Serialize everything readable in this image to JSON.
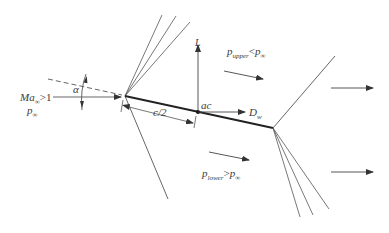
{
  "diagram": {
    "colors": {
      "line": "#555555",
      "chord": "#222222",
      "text": "#3a3a3a",
      "background": "#ffffff"
    },
    "labels": {
      "freestream_mach": {
        "base": "Ma",
        "sub": "∞",
        "rel": ">1"
      },
      "freestream_pressure": {
        "base": "p",
        "sub": "∞"
      },
      "angle_of_attack": "α",
      "half_chord": "c/2",
      "aero_center": "ac",
      "lift": "L",
      "wave_drag": {
        "base": "D",
        "sub": "w"
      },
      "upper_pressure": {
        "base": "p",
        "sub": "upper",
        "rel": "<",
        "rhs_base": "p",
        "rhs_sub": "∞"
      },
      "lower_pressure": {
        "base": "p",
        "sub": "lower",
        "rel": ">",
        "rhs_base": "p",
        "rhs_sub": "∞"
      },
      "tick_marks": [
        "ı",
        "ı"
      ]
    },
    "geometry": {
      "leading_edge": [
        125,
        96
      ],
      "aerodynamic_center": [
        198,
        112
      ],
      "trailing_edge": [
        273,
        128
      ],
      "upper_expansion_fan_ends": [
        [
          162,
          15
        ],
        [
          176,
          16
        ],
        [
          190,
          22
        ]
      ],
      "leading_edge_lower_shock_end": [
        168,
        199
      ],
      "trailing_edge_upper_shock_end": [
        335,
        56
      ],
      "lower_expansion_fan_ends": [
        [
          300,
          217
        ],
        [
          313,
          215
        ],
        [
          329,
          209
        ]
      ]
    }
  }
}
